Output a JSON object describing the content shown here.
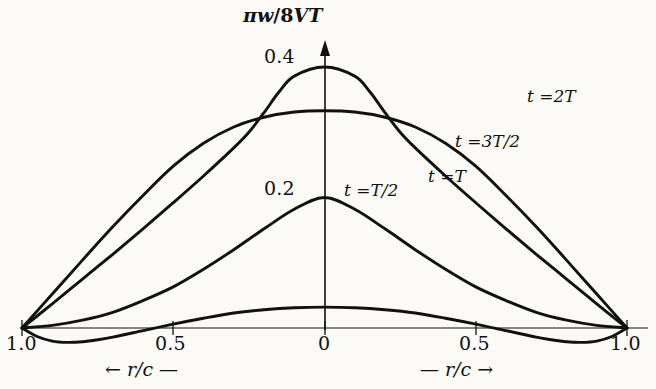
{
  "figure": {
    "background_color": "#fbfaf7",
    "ink_color": "#111111",
    "width": 656,
    "height": 389
  },
  "chart_data": {
    "type": "line",
    "title": "",
    "subtitle": "",
    "ylabel": "πw/8VT",
    "xlabel_left": "← r/c —",
    "xlabel_right": "— r/c →",
    "x_symbol": "r/c",
    "xlim": [
      -1.0,
      1.0
    ],
    "ylim": [
      -0.035,
      0.44
    ],
    "grid": false,
    "legend_position": "inline-annotations",
    "x_tick_labels": [
      "1.0",
      "0.5",
      "0",
      "0.5",
      "1.0"
    ],
    "x_tick_values": [
      -1.0,
      -0.5,
      0.0,
      0.5,
      1.0
    ],
    "y_tick_labels": [
      "0.2",
      "0.4"
    ],
    "y_tick_values": [
      0.2,
      0.4
    ],
    "series": [
      {
        "name": "t = T/2",
        "label": "t =T/2",
        "label_t": "t",
        "label_eq": "=",
        "label_val": "T/2",
        "peak_value": 0.2,
        "x": [
          -1.0,
          -0.9,
          -0.8,
          -0.7,
          -0.6,
          -0.5,
          -0.4,
          -0.3,
          -0.2,
          -0.1,
          0.0,
          0.1,
          0.2,
          0.3,
          0.4,
          0.5,
          0.6,
          0.7,
          0.8,
          0.9,
          1.0
        ],
        "values": [
          0.0,
          0.004,
          0.012,
          0.024,
          0.042,
          0.063,
          0.09,
          0.12,
          0.152,
          0.182,
          0.2,
          0.182,
          0.152,
          0.12,
          0.09,
          0.063,
          0.042,
          0.024,
          0.012,
          0.004,
          0.0
        ]
      },
      {
        "name": "t = T",
        "label": "t =T",
        "label_t": "t",
        "label_eq": "=",
        "label_val": "T",
        "peak_value": 0.4,
        "x": [
          -1.0,
          -0.9,
          -0.8,
          -0.7,
          -0.6,
          -0.5,
          -0.4,
          -0.3,
          -0.25,
          -0.2,
          -0.15,
          -0.1,
          0.0,
          0.1,
          0.15,
          0.2,
          0.25,
          0.3,
          0.4,
          0.5,
          0.6,
          0.7,
          0.8,
          0.9,
          1.0
        ],
        "values": [
          0.0,
          0.037,
          0.075,
          0.113,
          0.152,
          0.192,
          0.233,
          0.276,
          0.3,
          0.33,
          0.362,
          0.386,
          0.4,
          0.386,
          0.362,
          0.33,
          0.3,
          0.276,
          0.233,
          0.192,
          0.152,
          0.113,
          0.075,
          0.037,
          0.0
        ]
      },
      {
        "name": "t = 3T/2",
        "label": "t =3T/2",
        "label_t": "t",
        "label_eq": "=",
        "label_val": "3T/2",
        "peak_value": 0.33,
        "x": [
          -1.0,
          -0.9,
          -0.8,
          -0.7,
          -0.6,
          -0.5,
          -0.4,
          -0.3,
          -0.2,
          -0.1,
          0.0,
          0.1,
          0.2,
          0.3,
          0.4,
          0.5,
          0.6,
          0.7,
          0.8,
          0.9,
          1.0
        ],
        "values": [
          0.0,
          0.052,
          0.104,
          0.155,
          0.203,
          0.248,
          0.283,
          0.308,
          0.323,
          0.331,
          0.333,
          0.331,
          0.323,
          0.308,
          0.283,
          0.248,
          0.203,
          0.155,
          0.104,
          0.052,
          0.0
        ]
      },
      {
        "name": "t = 2T",
        "label": "t =2T",
        "label_t": "t",
        "label_eq": "=",
        "label_val": "2T",
        "peak_value": 0.335,
        "x": [
          -1.0,
          -0.95,
          -0.9,
          -0.85,
          -0.8,
          -0.75,
          -0.7,
          -0.6,
          -0.5,
          -0.4,
          -0.3,
          -0.2,
          -0.1,
          0.0,
          0.1,
          0.2,
          0.3,
          0.4,
          0.5,
          0.6,
          0.7,
          0.75,
          0.8,
          0.85,
          0.9,
          0.95,
          1.0
        ],
        "values": [
          0.0,
          -0.013,
          -0.02,
          -0.022,
          -0.021,
          -0.018,
          -0.014,
          -0.004,
          0.006,
          0.015,
          0.023,
          0.028,
          0.031,
          0.032,
          0.031,
          0.028,
          0.023,
          0.015,
          0.006,
          -0.004,
          -0.014,
          -0.018,
          -0.021,
          -0.022,
          -0.02,
          -0.013,
          0.0
        ]
      }
    ]
  },
  "annotations": {
    "y_axis_label": "πw/8VT",
    "curve_labels": [
      {
        "text": "t =2T",
        "x": 527,
        "y": 96
      },
      {
        "text": "t =3T/2",
        "x": 458,
        "y": 141
      },
      {
        "text": "t =T",
        "x": 430,
        "y": 176
      },
      {
        "text": "t =T/2",
        "x": 346,
        "y": 190
      }
    ],
    "y_ticks": [
      {
        "text": "0.4",
        "x": 267,
        "y": 45
      },
      {
        "text": "0.2",
        "x": 267,
        "y": 182
      }
    ],
    "x_ticks": [
      {
        "text": "1.0",
        "x": 8,
        "y": 333
      },
      {
        "text": "0.5",
        "x": 156,
        "y": 333
      },
      {
        "text": "0",
        "x": 317,
        "y": 333
      },
      {
        "text": "0.5",
        "x": 465,
        "y": 333
      },
      {
        "text": "1.0",
        "x": 612,
        "y": 333
      }
    ],
    "x_axis_names": [
      {
        "arrow": "←",
        "text": "r/c",
        "dash": "—",
        "x": 112,
        "y": 360
      },
      {
        "arrow_after": "→",
        "text": "r/c",
        "dash": "—",
        "x": 425,
        "y": 360
      }
    ]
  }
}
